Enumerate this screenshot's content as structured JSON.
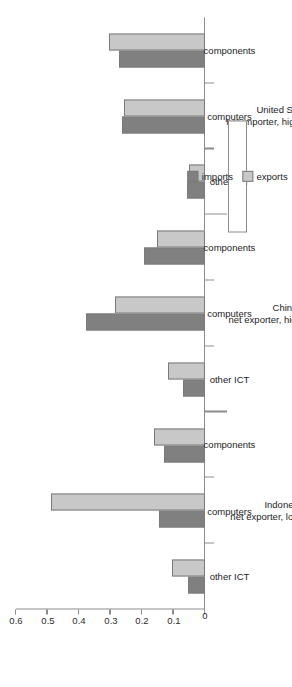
{
  "chart_data": {
    "type": "bar",
    "orientation": "horizontal-rotated",
    "title": "",
    "xlabel": "",
    "ylabel": "",
    "ylim": [
      0,
      0.6
    ],
    "grid": false,
    "tick_labels": [
      "0",
      "0.1",
      "0.2",
      "0.3",
      "0.4",
      "0.5",
      "0.6"
    ],
    "tick_values": [
      0,
      0.1,
      0.2,
      0.3,
      0.4,
      0.5,
      0.6
    ],
    "categories": [
      "other ICT",
      "computers",
      "components"
    ],
    "groups": [
      {
        "name": "Indonesia",
        "note": "net exporter, lower growth",
        "categories": [
          "other ICT",
          "computers",
          "components"
        ],
        "imports": [
          0.054,
          0.146,
          0.13
        ],
        "exports": [
          0.105,
          0.49,
          0.162
        ]
      },
      {
        "name": "China",
        "note": "net exporter, higher growth",
        "categories": [
          "other ICT",
          "computers",
          "components"
        ],
        "imports": [
          0.07,
          0.378,
          0.193
        ],
        "exports": [
          0.117,
          0.286,
          0.152
        ]
      },
      {
        "name": "United States",
        "note": "net importer, highest growth",
        "categories": [
          "other ICT",
          "computers",
          "components"
        ],
        "imports": [
          0.057,
          0.263,
          0.273
        ],
        "exports": [
          0.051,
          0.257,
          0.305
        ]
      }
    ],
    "series": [
      {
        "name": "imports",
        "color": "#808080"
      },
      {
        "name": "exports",
        "color": "#c8c8c8"
      }
    ],
    "legend": {
      "position": "right-middle",
      "entries": [
        {
          "label": "imports",
          "color": "#808080"
        },
        {
          "label": "exports",
          "color": "#c8c8c8"
        }
      ]
    }
  }
}
